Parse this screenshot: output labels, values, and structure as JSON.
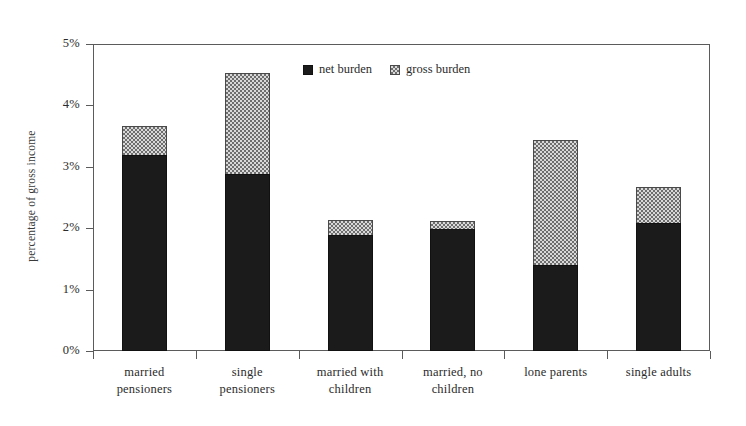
{
  "chart_data": {
    "type": "bar",
    "title": "",
    "subtitle": "",
    "xlabel": "",
    "ylabel": "percentage of gross income",
    "ylim": [
      0,
      5
    ],
    "ytick_labels": [
      "0%",
      "1%",
      "2%",
      "3%",
      "4%",
      "5%"
    ],
    "ytick_values": [
      0,
      1,
      2,
      3,
      4,
      5
    ],
    "grid": false,
    "stacked": true,
    "legend_position": "top-center",
    "categories": [
      "married\npensioners",
      "single\npensioners",
      "married with\nchildren",
      "married, no\nchildren",
      "lone parents",
      "single adults"
    ],
    "category_lines": [
      [
        "married",
        "pensioners"
      ],
      [
        "single",
        "pensioners"
      ],
      [
        "married with",
        "children"
      ],
      [
        "married, no",
        "children"
      ],
      [
        "lone parents",
        ""
      ],
      [
        "single adults",
        ""
      ]
    ],
    "series": [
      {
        "name": "net burden",
        "fill": "solid-black",
        "color": "#1b1b1b",
        "values": [
          3.19,
          2.88,
          1.89,
          1.99,
          1.4,
          2.08
        ]
      },
      {
        "name": "gross burden",
        "fill": "checkered-gray",
        "color": "#d9d9d9",
        "values": [
          3.67,
          4.53,
          2.13,
          2.12,
          3.44,
          2.67
        ]
      }
    ],
    "annotations": []
  },
  "legend": {
    "items": [
      {
        "label": "net burden",
        "swatch": "solid-black-square"
      },
      {
        "label": "gross burden",
        "swatch": "checkered-gray-square"
      }
    ]
  },
  "axis": {
    "y_title": "percentage of gross income"
  },
  "colors": {
    "net": "#1b1b1b",
    "gross": "#d9d9d9",
    "frame": "#5b5b5b",
    "background": "#ffffff"
  }
}
